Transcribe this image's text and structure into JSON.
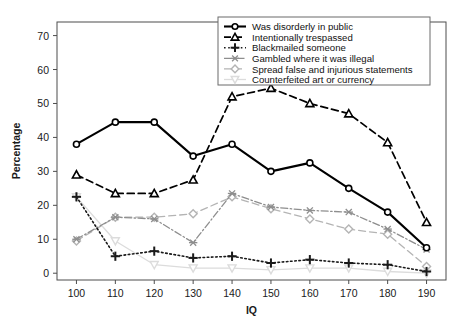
{
  "chart_data": {
    "type": "line",
    "title": "",
    "xlabel": "IQ",
    "ylabel": "Percentage",
    "x": [
      100,
      110,
      120,
      130,
      140,
      150,
      160,
      170,
      180,
      190
    ],
    "xticklabels": [
      "100",
      "110",
      "120",
      "130",
      "140",
      "150",
      "160",
      "170",
      "180",
      "190"
    ],
    "yticklabels": [
      "0",
      "10",
      "20",
      "30",
      "40",
      "50",
      "60",
      "70"
    ],
    "yticks": [
      0,
      10,
      20,
      30,
      40,
      50,
      60,
      70
    ],
    "xlim": [
      95,
      195
    ],
    "ylim": [
      -2,
      74
    ],
    "grid": false,
    "legend_position": "top-right",
    "series": [
      {
        "name": "Was disorderly in public",
        "values": [
          38,
          44.5,
          44.5,
          34.5,
          38,
          30,
          32.5,
          25,
          18,
          7.5
        ],
        "color": "#000000",
        "marker": "circle",
        "dash": "none",
        "width": 2.1
      },
      {
        "name": "Intentionally trespassed",
        "values": [
          29,
          23.5,
          23.5,
          27.5,
          52,
          54.5,
          50,
          47,
          38.5,
          15
        ],
        "color": "#000000",
        "marker": "triangle",
        "dash": "7,4",
        "width": 1.7
      },
      {
        "name": "Blackmailed someone",
        "values": [
          22.5,
          5,
          6.5,
          4.5,
          5,
          3,
          4,
          3,
          2.5,
          0.5
        ],
        "color": "#1a1a1a",
        "marker": "plus",
        "dash": "1.6,2.6",
        "width": 1.6
      },
      {
        "name": "Gambled where it was illegal",
        "values": [
          10,
          16.5,
          16,
          9,
          23.5,
          19.5,
          18.5,
          18,
          13,
          7
        ],
        "color": "#8e8e8e",
        "marker": "asterisk",
        "dash": "7,2.5,1.5,2.5",
        "width": 1.3
      },
      {
        "name": "Spread false and injurious statements",
        "values": [
          9.5,
          16.5,
          16.5,
          17.5,
          22.5,
          19,
          16,
          13,
          11.5,
          2
        ],
        "color": "#b4b4b4",
        "marker": "diamond",
        "dash": "7,4",
        "width": 1.3
      },
      {
        "name": "Counterfeited art or currency",
        "values": [
          22.5,
          9.5,
          2.5,
          1.5,
          1.5,
          1,
          1.5,
          1.5,
          0.5,
          0
        ],
        "color": "#dcdcdc",
        "marker": "triangle-down",
        "dash": "none",
        "width": 1.3
      }
    ]
  }
}
